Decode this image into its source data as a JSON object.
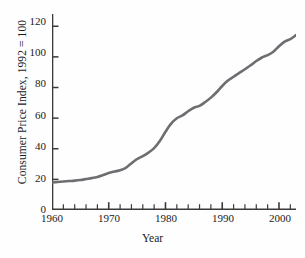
{
  "chart_data": {
    "type": "line",
    "title": "",
    "xlabel": "Year",
    "ylabel": "Consumer Price Index, 1992 = 100",
    "xlim": [
      1960,
      2003
    ],
    "ylim": [
      0,
      128
    ],
    "grid": false,
    "legend": null,
    "line_color": "#6e6e72",
    "axis_color": "#3a3a3a",
    "x_major_ticks": [
      1960,
      1970,
      1980,
      1990,
      2000
    ],
    "x_major_tick_labels": [
      "1960",
      "1970",
      "1980",
      "1990",
      "2000"
    ],
    "x_minor_tick_interval": 2,
    "y_major_ticks": [
      0,
      20,
      40,
      60,
      80,
      100,
      120
    ],
    "y_major_tick_labels": [
      "0",
      "20",
      "40",
      "60",
      "80",
      "100",
      "120"
    ],
    "series": [
      {
        "name": "Consumer Price Index",
        "x": [
          1960,
          1961,
          1962,
          1963,
          1964,
          1965,
          1966,
          1967,
          1968,
          1969,
          1970,
          1971,
          1972,
          1973,
          1974,
          1975,
          1976,
          1977,
          1978,
          1979,
          1980,
          1981,
          1982,
          1983,
          1984,
          1985,
          1986,
          1987,
          1988,
          1989,
          1990,
          1991,
          1992,
          1993,
          1994,
          1995,
          1996,
          1997,
          1998,
          1999,
          2000,
          2001,
          2002,
          2003
        ],
        "values": [
          18.0,
          18.3,
          18.6,
          18.9,
          19.2,
          19.6,
          20.2,
          20.8,
          21.6,
          22.8,
          24.1,
          25.1,
          25.9,
          27.5,
          30.5,
          33.3,
          35.2,
          37.5,
          40.4,
          45.0,
          51.1,
          56.4,
          59.9,
          61.8,
          64.5,
          66.8,
          68.0,
          70.5,
          73.4,
          76.9,
          81.0,
          84.5,
          87.0,
          89.6,
          91.9,
          94.5,
          97.3,
          99.6,
          101.1,
          103.4,
          106.9,
          109.9,
          111.6,
          114.2
        ]
      }
    ]
  },
  "axis": {
    "y_labels": [
      "120",
      "100",
      "80",
      "60",
      "40",
      "20",
      "0"
    ],
    "x_labels": [
      "1960",
      "1970",
      "1980",
      "1990",
      "2000"
    ],
    "y_title": "Consumer Price Index, 1992 = 100",
    "x_title": "Year"
  }
}
